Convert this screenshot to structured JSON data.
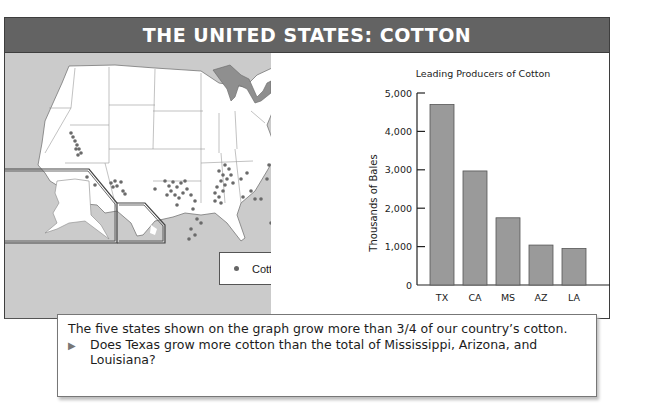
{
  "header": {
    "title": "THE UNITED STATES: COTTON"
  },
  "map": {
    "legend": {
      "symbol": "dot",
      "label": "Cotton",
      "dot_color": "#666666"
    },
    "background_color": "#cbcbcb",
    "lake_color": "#8f8f8f",
    "insets": [
      "Alaska",
      "Hawaii"
    ]
  },
  "chart_data": {
    "type": "bar",
    "title": "Leading Producers of Cotton",
    "xlabel": "",
    "ylabel": "Thousands of Bales",
    "categories": [
      "TX",
      "CA",
      "MS",
      "AZ",
      "LA"
    ],
    "values": [
      4700,
      2970,
      1750,
      1040,
      950
    ],
    "ylim": [
      0,
      5000
    ],
    "yticks": [
      0,
      1000,
      2000,
      3000,
      4000,
      5000
    ],
    "ytick_labels": [
      "0",
      "1,000",
      "2,000",
      "3,000",
      "4,000",
      "5,000"
    ],
    "grid": false,
    "legend": null,
    "bar_color": "#9a9a9a"
  },
  "caption": {
    "statement": "The five states shown on the graph grow more than 3/4 of our country’s cotton.",
    "bullet": "▶",
    "question": "Does Texas grow more cotton than the total of Mississippi, Arizona, and Louisiana?"
  }
}
